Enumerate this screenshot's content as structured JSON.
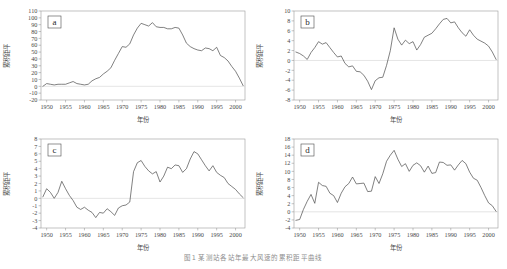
{
  "figure": {
    "caption": "图1  某测站各站年最大风速的累积距平曲线",
    "background_color": "#ffffff",
    "line_color": "#4a4a4a",
    "frame_color": "#9a9a9a",
    "zero_line_color": "#c9c9c9"
  },
  "chart_data": [
    {
      "type": "line",
      "panel_label": "a",
      "title": "",
      "xlabel": "年份",
      "ylabel": "累积距平",
      "xlim": [
        1948.5,
        2002.5
      ],
      "ylim": [
        -20,
        110
      ],
      "xticks": [
        1950,
        1955,
        1960,
        1965,
        1970,
        1975,
        1980,
        1985,
        1990,
        1995,
        2000
      ],
      "yticks": [
        -20,
        -10,
        0,
        10,
        20,
        30,
        40,
        50,
        60,
        70,
        80,
        90,
        100,
        110
      ],
      "grid": false,
      "legend": "none",
      "x": [
        1949,
        1950,
        1951,
        1952,
        1953,
        1954,
        1955,
        1956,
        1957,
        1958,
        1959,
        1960,
        1961,
        1962,
        1963,
        1964,
        1965,
        1966,
        1967,
        1968,
        1969,
        1970,
        1971,
        1972,
        1973,
        1974,
        1975,
        1976,
        1977,
        1978,
        1979,
        1980,
        1981,
        1982,
        1983,
        1984,
        1985,
        1986,
        1987,
        1988,
        1989,
        1990,
        1991,
        1992,
        1993,
        1994,
        1995,
        1996,
        1997,
        1998,
        1999,
        2000,
        2001,
        2002
      ],
      "values": [
        0,
        4,
        3,
        2,
        3,
        3,
        3,
        5,
        7,
        4,
        3,
        2,
        3,
        8,
        11,
        13,
        18,
        22,
        27,
        38,
        48,
        58,
        57,
        62,
        75,
        85,
        92,
        90,
        88,
        93,
        87,
        86,
        86,
        84,
        84,
        86,
        85,
        75,
        63,
        58,
        55,
        53,
        52,
        56,
        55,
        52,
        57,
        45,
        42,
        37,
        29,
        22,
        12,
        1
      ]
    },
    {
      "type": "line",
      "panel_label": "b",
      "title": "",
      "xlabel": "年份",
      "ylabel": "累积距平",
      "xlim": [
        1948.5,
        2002.5
      ],
      "ylim": [
        -8,
        10
      ],
      "xticks": [
        1950,
        1955,
        1960,
        1965,
        1970,
        1975,
        1980,
        1985,
        1990,
        1995,
        2000
      ],
      "yticks": [
        -8,
        -6,
        -4,
        -2,
        0,
        2,
        4,
        6,
        8,
        10
      ],
      "grid": false,
      "legend": "none",
      "x": [
        1949,
        1950,
        1951,
        1952,
        1953,
        1954,
        1955,
        1956,
        1957,
        1958,
        1959,
        1960,
        1961,
        1962,
        1963,
        1964,
        1965,
        1966,
        1967,
        1968,
        1969,
        1970,
        1971,
        1972,
        1973,
        1974,
        1975,
        1976,
        1977,
        1978,
        1979,
        1980,
        1981,
        1982,
        1983,
        1984,
        1985,
        1986,
        1987,
        1988,
        1989,
        1990,
        1991,
        1992,
        1993,
        1994,
        1995,
        1996,
        1997,
        1998,
        1999,
        2000,
        2001,
        2002
      ],
      "values": [
        1.7,
        1.4,
        0.9,
        0.2,
        1.6,
        2.6,
        3.8,
        3.3,
        3.6,
        2.6,
        1.6,
        0.7,
        0.9,
        -0.6,
        -1.3,
        -1.1,
        -2.2,
        -2.3,
        -3.0,
        -4.2,
        -5.9,
        -4.1,
        -3.5,
        -3.4,
        -1.0,
        2.0,
        6.6,
        4.3,
        3.1,
        4.1,
        3.4,
        3.8,
        2.1,
        3.2,
        4.7,
        5.1,
        5.5,
        6.4,
        7.4,
        8.3,
        8.5,
        7.6,
        7.8,
        6.6,
        5.6,
        4.9,
        6.2,
        5.1,
        4.3,
        3.9,
        3.5,
        2.9,
        1.7,
        0.2
      ]
    },
    {
      "type": "line",
      "panel_label": "c",
      "title": "",
      "xlabel": "年份",
      "ylabel": "累积距平",
      "xlim": [
        1948.5,
        2002.5
      ],
      "ylim": [
        -4,
        8
      ],
      "xticks": [
        1950,
        1955,
        1960,
        1965,
        1970,
        1975,
        1980,
        1985,
        1990,
        1995,
        2000
      ],
      "yticks": [
        -4,
        -3,
        -2,
        -1,
        0,
        1,
        2,
        3,
        4,
        5,
        6,
        7,
        8
      ],
      "grid": false,
      "legend": "none",
      "x": [
        1949,
        1950,
        1951,
        1952,
        1953,
        1954,
        1955,
        1956,
        1957,
        1958,
        1959,
        1960,
        1961,
        1962,
        1963,
        1964,
        1965,
        1966,
        1967,
        1968,
        1969,
        1970,
        1971,
        1972,
        1973,
        1974,
        1975,
        1976,
        1977,
        1978,
        1979,
        1980,
        1981,
        1982,
        1983,
        1984,
        1985,
        1986,
        1987,
        1988,
        1989,
        1990,
        1991,
        1992,
        1993,
        1994,
        1995,
        1996,
        1997,
        1998,
        1999,
        2000,
        2001,
        2002
      ],
      "values": [
        0.2,
        1.3,
        0.8,
        0.0,
        0.8,
        2.3,
        1.3,
        0.4,
        -0.3,
        -1.2,
        -1.5,
        -1.2,
        -1.6,
        -1.9,
        -2.6,
        -1.9,
        -2.0,
        -1.4,
        -1.8,
        -2.3,
        -1.3,
        -1.0,
        -0.9,
        -0.5,
        3.6,
        4.8,
        5.1,
        4.3,
        3.7,
        3.3,
        3.6,
        2.2,
        3.0,
        4.2,
        4.0,
        4.5,
        4.4,
        3.5,
        4.0,
        5.3,
        6.3,
        6.0,
        5.2,
        4.4,
        3.7,
        4.4,
        3.5,
        3.1,
        2.8,
        2.0,
        1.6,
        1.2,
        0.6,
        0.1
      ]
    },
    {
      "type": "line",
      "panel_label": "d",
      "title": "",
      "xlabel": "年份",
      "ylabel": "累积距平",
      "xlim": [
        1948.5,
        2002.5
      ],
      "ylim": [
        -4,
        18
      ],
      "xticks": [
        1950,
        1955,
        1960,
        1965,
        1970,
        1975,
        1980,
        1985,
        1990,
        1995,
        2000
      ],
      "yticks": [
        -4,
        -2,
        0,
        2,
        4,
        6,
        8,
        10,
        12,
        14,
        16,
        18
      ],
      "grid": false,
      "legend": "none",
      "x": [
        1949,
        1950,
        1951,
        1952,
        1953,
        1954,
        1955,
        1956,
        1957,
        1958,
        1959,
        1960,
        1961,
        1962,
        1963,
        1964,
        1965,
        1966,
        1967,
        1968,
        1969,
        1970,
        1971,
        1972,
        1973,
        1974,
        1975,
        1976,
        1977,
        1978,
        1979,
        1980,
        1981,
        1982,
        1983,
        1984,
        1985,
        1986,
        1987,
        1988,
        1989,
        1990,
        1991,
        1992,
        1993,
        1994,
        1995,
        1996,
        1997,
        1998,
        1999,
        2000,
        2001,
        2002
      ],
      "values": [
        -2.1,
        -1.9,
        0.6,
        2.6,
        4.3,
        2.1,
        7.3,
        6.5,
        6.3,
        4.6,
        4.0,
        2.3,
        4.6,
        6.2,
        7.0,
        8.6,
        6.9,
        7.0,
        7.1,
        5.0,
        5.1,
        8.7,
        7.0,
        9.4,
        12.5,
        14.0,
        15.2,
        13.0,
        11.2,
        11.9,
        10.0,
        11.5,
        12.1,
        11.4,
        9.8,
        11.3,
        9.5,
        9.7,
        12.3,
        12.2,
        11.5,
        11.6,
        10.3,
        11.6,
        12.7,
        11.9,
        9.8,
        8.3,
        7.8,
        6.0,
        4.0,
        2.2,
        1.5,
        0.1
      ]
    }
  ]
}
